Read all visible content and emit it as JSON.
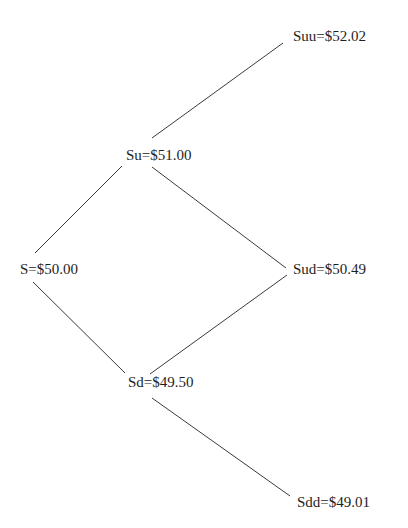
{
  "diagram": {
    "type": "binomial-tree",
    "nodes": {
      "s": {
        "label": "S=$50.00"
      },
      "su": {
        "label": "Su=$51.00"
      },
      "sd": {
        "label": "Sd=$49.50"
      },
      "suu": {
        "label": "Suu=$52.02"
      },
      "sud": {
        "label": "Sud=$50.49"
      },
      "sdd": {
        "label": "Sdd=$49.01"
      }
    },
    "edges": [
      {
        "from": "s",
        "to": "su"
      },
      {
        "from": "s",
        "to": "sd"
      },
      {
        "from": "su",
        "to": "suu"
      },
      {
        "from": "su",
        "to": "sud"
      },
      {
        "from": "sd",
        "to": "sud"
      },
      {
        "from": "sd",
        "to": "sdd"
      }
    ],
    "line_color": "#3a3a3a",
    "text_color": "#1e1e1e"
  }
}
